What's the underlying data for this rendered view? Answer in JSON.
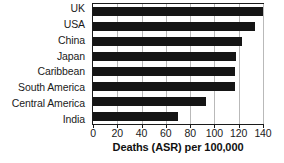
{
  "chart_data": {
    "type": "bar",
    "orientation": "horizontal",
    "title": "",
    "xlabel": "Deaths (ASR) per 100,000",
    "ylabel": "",
    "xlim": [
      0,
      140
    ],
    "xticks": [
      0,
      20,
      40,
      60,
      80,
      100,
      120,
      140
    ],
    "xtick_labels": [
      "0",
      "20",
      "40",
      "60",
      "80",
      "100",
      "120",
      "140"
    ],
    "grid": "vertical",
    "legend": "none",
    "bar_color": "#151515",
    "categories": [
      "UK",
      "USA",
      "China",
      "Japan",
      "Caribbean",
      "South America",
      "Central America",
      "India"
    ],
    "values": [
      142,
      133,
      123,
      118,
      117,
      117,
      93,
      70
    ]
  }
}
